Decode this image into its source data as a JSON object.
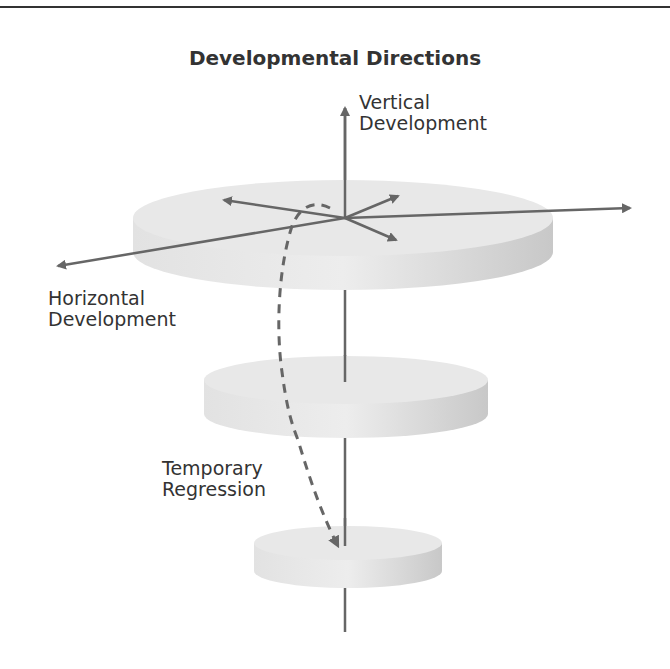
{
  "title": "Developmental Directions",
  "labels": {
    "vertical": {
      "line1": "Vertical",
      "line2": "Development"
    },
    "horizontal": {
      "line1": "Horizontal",
      "line2": "Development"
    },
    "regression": {
      "line1": "Temporary",
      "line2": "Regression"
    }
  },
  "colors": {
    "arrow": "#666666",
    "disc_top": "#e6e6e6",
    "disc_side": "#d4d4d4",
    "text": "#333333"
  },
  "discs": [
    {
      "name": "top-level",
      "cx": 343,
      "cy": 218,
      "rx": 210,
      "ry": 38,
      "thickness": 34
    },
    {
      "name": "middle-level",
      "cx": 346,
      "cy": 380,
      "rx": 142,
      "ry": 24,
      "thickness": 34
    },
    {
      "name": "bottom-level",
      "cx": 348,
      "cy": 543,
      "rx": 94,
      "ry": 17,
      "thickness": 28
    }
  ]
}
